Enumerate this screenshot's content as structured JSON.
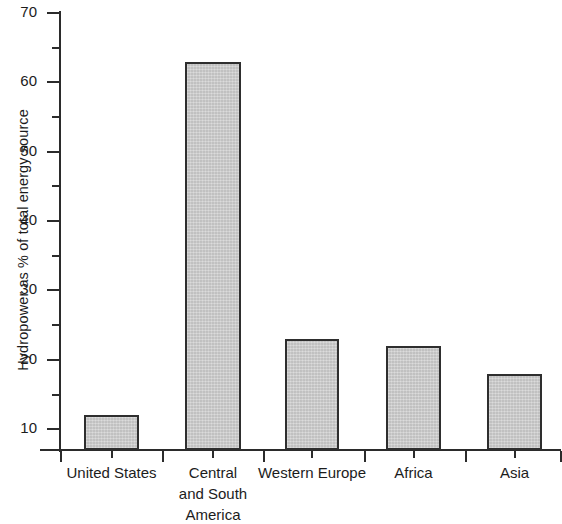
{
  "chart_data": {
    "type": "bar",
    "title": "",
    "xlabel": "",
    "ylabel": "Hydropower as % of total energy source",
    "categories": [
      "United States",
      "Central and South America",
      "Western Europe",
      "Africa",
      "Asia"
    ],
    "category_label_lines": [
      [
        "United States"
      ],
      [
        "Central",
        "and South",
        "America"
      ],
      [
        "Western Europe"
      ],
      [
        "Africa"
      ],
      [
        "Asia"
      ]
    ],
    "values": [
      12,
      63,
      23,
      22,
      18
    ],
    "ylim": [
      7,
      70
    ],
    "ytick_labels": [
      "10",
      "20",
      "30",
      "40",
      "50",
      "60",
      "70"
    ],
    "ytick_values": [
      10,
      20,
      30,
      40,
      50,
      60,
      70
    ],
    "yminor_tick_values": [
      15,
      25,
      35,
      45,
      55,
      65
    ],
    "grid": false,
    "legend": null,
    "bar_fill_color": "#cccccc",
    "bar_edge_color": "#2e2e2e",
    "axis_color": "#2b2b2b",
    "background_color": "#ffffff"
  },
  "axis": {
    "y_title": "Hydropower as % of total energy source"
  }
}
